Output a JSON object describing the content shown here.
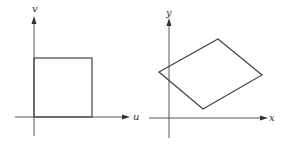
{
  "diagram": {
    "colors": {
      "axis": "#555555",
      "shape": "#444444",
      "label": "#333333",
      "background": "#ffffff"
    },
    "panels": [
      {
        "name": "uv-plane",
        "horizontal_axis_label": "u",
        "vertical_axis_label": "v",
        "shape": "square"
      },
      {
        "name": "xy-plane",
        "horizontal_axis_label": "x",
        "vertical_axis_label": "y",
        "shape": "parallelogram"
      }
    ]
  }
}
